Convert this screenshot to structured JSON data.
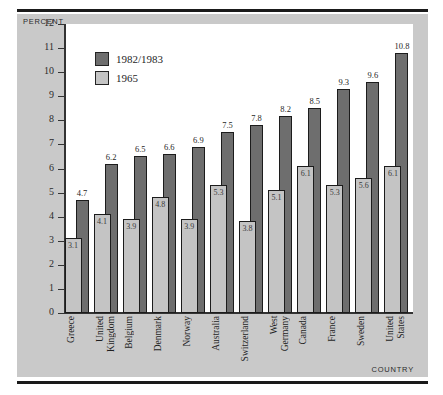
{
  "figure": {
    "y_axis_title": "PERCENT",
    "x_axis_title": "COUNTRY"
  },
  "legend": {
    "items": [
      {
        "label": "1982/1983",
        "color": "#6e6e6e"
      },
      {
        "label": "1965",
        "color": "#c4c4c4"
      }
    ]
  },
  "chart_data": {
    "type": "bar",
    "title": "",
    "xlabel": "COUNTRY",
    "ylabel": "PERCENT",
    "ylim": [
      0,
      12
    ],
    "yticks": [
      0,
      1,
      2,
      3,
      4,
      5,
      6,
      7,
      8,
      9,
      10,
      11,
      12
    ],
    "grid": false,
    "legend_position": "top-left",
    "categories": [
      "Greece",
      "United Kingdom",
      "Belgium",
      "Denmark",
      "Norway",
      "Australia",
      "Switzerland",
      "West Germany",
      "Canada",
      "France",
      "Sweden",
      "United States"
    ],
    "category_lines": [
      [
        "Greece"
      ],
      [
        "United",
        "Kingdom"
      ],
      [
        "Belgium"
      ],
      [
        "Denmark"
      ],
      [
        "Norway"
      ],
      [
        "Australia"
      ],
      [
        "Switzerland"
      ],
      [
        "West",
        "Germany"
      ],
      [
        "Canada"
      ],
      [
        "France"
      ],
      [
        "Sweden"
      ],
      [
        "United",
        "States"
      ]
    ],
    "series": [
      {
        "name": "1982/1983",
        "color": "#6e6e6e",
        "values": [
          4.7,
          6.2,
          6.5,
          6.6,
          6.9,
          7.5,
          7.8,
          8.2,
          8.5,
          9.3,
          9.6,
          10.8
        ]
      },
      {
        "name": "1965",
        "color": "#c4c4c4",
        "values": [
          3.1,
          4.1,
          3.9,
          4.8,
          3.9,
          5.3,
          3.8,
          5.1,
          6.1,
          5.3,
          5.6,
          6.1
        ]
      }
    ]
  }
}
